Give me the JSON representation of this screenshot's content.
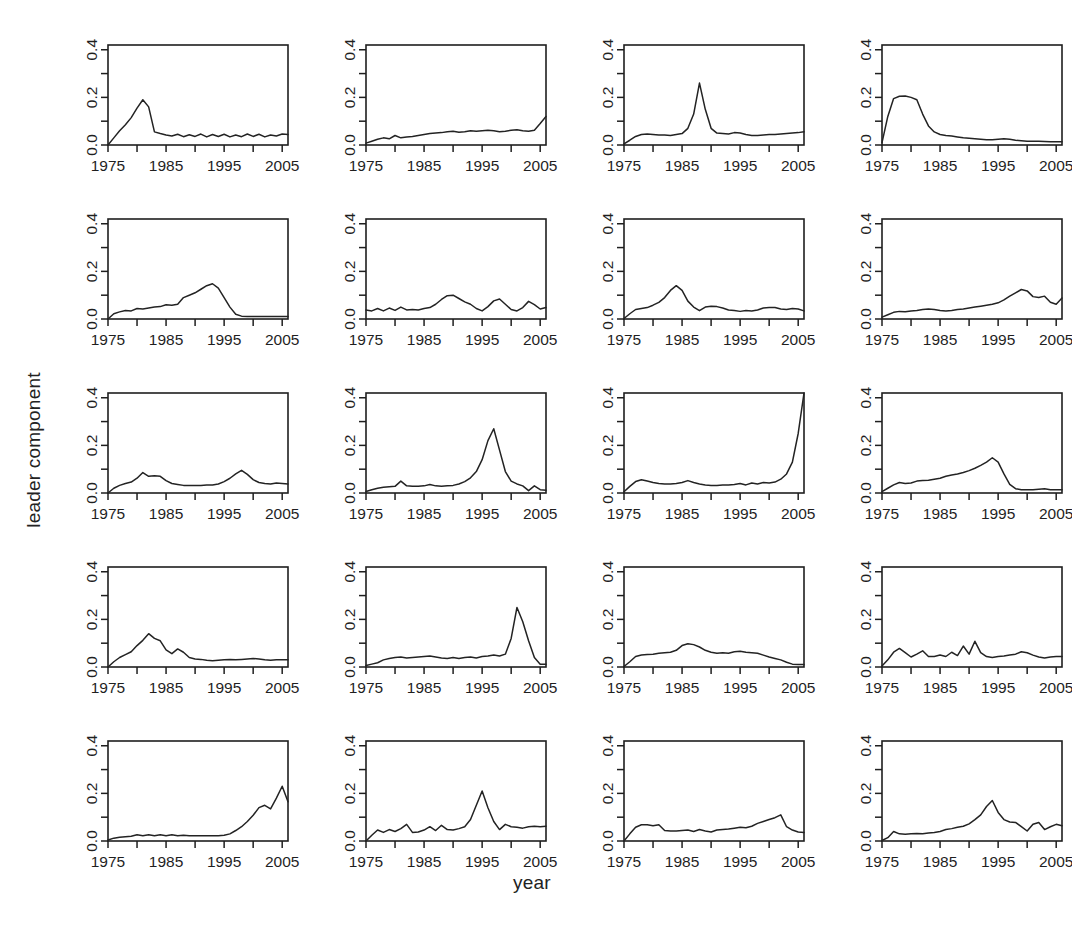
{
  "figure": {
    "xlabel": "year",
    "ylabel": "leader component",
    "rows": 5,
    "cols": 4,
    "line_color": "#232323",
    "axis_color": "#1f1f1f",
    "background": "#ffffff"
  },
  "chart_data": {
    "type": "line",
    "title": "",
    "subtitle": "",
    "xlabel": "year",
    "ylabel": "leader component",
    "layout": {
      "rows": 5,
      "cols": 4,
      "n_panels": 20,
      "shared_axes": true,
      "grid": false,
      "legend": "none"
    },
    "xlim": [
      1975,
      2006
    ],
    "ylim": [
      0.0,
      0.42
    ],
    "xticks": [
      1975,
      1980,
      1985,
      1990,
      1995,
      2000,
      2005
    ],
    "xticklabels": [
      "1975",
      "",
      "1985",
      "",
      "1995",
      "",
      "2005"
    ],
    "yticks": [
      0.0,
      0.1,
      0.2,
      0.3,
      0.4
    ],
    "yticklabels": [
      "0.0",
      "",
      "0.2",
      "",
      "0.4"
    ],
    "x": [
      1975,
      1976,
      1977,
      1978,
      1979,
      1980,
      1981,
      1982,
      1983,
      1984,
      1985,
      1986,
      1987,
      1988,
      1989,
      1990,
      1991,
      1992,
      1993,
      1994,
      1995,
      1996,
      1997,
      1998,
      1999,
      2000,
      2001,
      2002,
      2003,
      2004,
      2005,
      2006
    ],
    "panels": [
      {
        "index": 1,
        "row": 1,
        "col": 1,
        "values": [
          0.0,
          0.03,
          0.06,
          0.085,
          0.115,
          0.155,
          0.19,
          0.16,
          0.055,
          0.048,
          0.042,
          0.038,
          0.045,
          0.035,
          0.043,
          0.036,
          0.046,
          0.034,
          0.044,
          0.036,
          0.045,
          0.034,
          0.042,
          0.035,
          0.046,
          0.036,
          0.045,
          0.034,
          0.042,
          0.038,
          0.046,
          0.044
        ],
        "peak": {
          "year": 1981,
          "value": 0.19
        }
      },
      {
        "index": 2,
        "row": 1,
        "col": 2,
        "values": [
          0.008,
          0.016,
          0.024,
          0.03,
          0.026,
          0.04,
          0.03,
          0.034,
          0.036,
          0.04,
          0.044,
          0.048,
          0.05,
          0.052,
          0.056,
          0.058,
          0.054,
          0.056,
          0.06,
          0.058,
          0.06,
          0.062,
          0.06,
          0.056,
          0.058,
          0.062,
          0.064,
          0.06,
          0.058,
          0.062,
          0.09,
          0.12
        ],
        "peak": {
          "year": 2006,
          "value": 0.12
        }
      },
      {
        "index": 3,
        "row": 1,
        "col": 3,
        "values": [
          0.005,
          0.02,
          0.036,
          0.044,
          0.046,
          0.044,
          0.042,
          0.042,
          0.04,
          0.044,
          0.048,
          0.07,
          0.13,
          0.26,
          0.15,
          0.07,
          0.05,
          0.048,
          0.046,
          0.052,
          0.05,
          0.044,
          0.04,
          0.04,
          0.042,
          0.044,
          0.044,
          0.046,
          0.048,
          0.05,
          0.052,
          0.056
        ],
        "peak": {
          "year": 1988,
          "value": 0.26
        }
      },
      {
        "index": 4,
        "row": 1,
        "col": 4,
        "values": [
          0.01,
          0.12,
          0.195,
          0.205,
          0.206,
          0.2,
          0.19,
          0.13,
          0.08,
          0.055,
          0.044,
          0.04,
          0.038,
          0.034,
          0.03,
          0.028,
          0.026,
          0.024,
          0.022,
          0.022,
          0.024,
          0.026,
          0.024,
          0.02,
          0.018,
          0.016,
          0.016,
          0.016,
          0.015,
          0.014,
          0.014,
          0.014
        ],
        "peak": {
          "year": 1979,
          "value": 0.206
        }
      },
      {
        "index": 5,
        "row": 2,
        "col": 1,
        "values": [
          0.0,
          0.022,
          0.03,
          0.036,
          0.034,
          0.044,
          0.042,
          0.046,
          0.05,
          0.052,
          0.06,
          0.058,
          0.062,
          0.09,
          0.1,
          0.11,
          0.125,
          0.14,
          0.148,
          0.13,
          0.09,
          0.05,
          0.02,
          0.012,
          0.01,
          0.01,
          0.01,
          0.01,
          0.01,
          0.01,
          0.01,
          0.01
        ],
        "peak": {
          "year": 1993,
          "value": 0.148
        }
      },
      {
        "index": 6,
        "row": 2,
        "col": 2,
        "values": [
          0.038,
          0.034,
          0.044,
          0.034,
          0.046,
          0.036,
          0.05,
          0.038,
          0.04,
          0.038,
          0.044,
          0.048,
          0.062,
          0.082,
          0.098,
          0.1,
          0.086,
          0.072,
          0.062,
          0.044,
          0.034,
          0.052,
          0.076,
          0.084,
          0.062,
          0.04,
          0.034,
          0.048,
          0.074,
          0.06,
          0.042,
          0.048
        ],
        "peak": {
          "year": 1990,
          "value": 0.1
        }
      },
      {
        "index": 7,
        "row": 2,
        "col": 3,
        "values": [
          0.002,
          0.022,
          0.04,
          0.044,
          0.048,
          0.058,
          0.07,
          0.09,
          0.12,
          0.14,
          0.12,
          0.075,
          0.05,
          0.035,
          0.05,
          0.054,
          0.052,
          0.046,
          0.038,
          0.036,
          0.032,
          0.036,
          0.034,
          0.038,
          0.046,
          0.048,
          0.048,
          0.042,
          0.04,
          0.044,
          0.042,
          0.034
        ],
        "peak": {
          "year": 1984,
          "value": 0.14
        }
      },
      {
        "index": 8,
        "row": 2,
        "col": 4,
        "values": [
          0.008,
          0.018,
          0.028,
          0.032,
          0.03,
          0.034,
          0.036,
          0.04,
          0.042,
          0.04,
          0.036,
          0.034,
          0.036,
          0.04,
          0.042,
          0.046,
          0.05,
          0.054,
          0.058,
          0.062,
          0.068,
          0.08,
          0.096,
          0.11,
          0.124,
          0.118,
          0.094,
          0.09,
          0.096,
          0.07,
          0.062,
          0.088
        ],
        "peak": {
          "year": 1999,
          "value": 0.124
        }
      },
      {
        "index": 9,
        "row": 3,
        "col": 1,
        "values": [
          0.0,
          0.02,
          0.032,
          0.04,
          0.046,
          0.062,
          0.086,
          0.07,
          0.072,
          0.07,
          0.052,
          0.04,
          0.036,
          0.032,
          0.032,
          0.032,
          0.032,
          0.034,
          0.034,
          0.038,
          0.048,
          0.062,
          0.08,
          0.095,
          0.078,
          0.056,
          0.044,
          0.04,
          0.038,
          0.042,
          0.04,
          0.038
        ],
        "peak": {
          "year": 1998,
          "value": 0.095
        }
      },
      {
        "index": 10,
        "row": 3,
        "col": 2,
        "values": [
          0.006,
          0.014,
          0.02,
          0.024,
          0.026,
          0.028,
          0.05,
          0.03,
          0.028,
          0.028,
          0.03,
          0.036,
          0.03,
          0.028,
          0.03,
          0.032,
          0.038,
          0.048,
          0.064,
          0.09,
          0.14,
          0.22,
          0.27,
          0.18,
          0.09,
          0.05,
          0.038,
          0.03,
          0.01,
          0.03,
          0.014,
          0.012
        ],
        "peak": {
          "year": 1997,
          "value": 0.27
        }
      },
      {
        "index": 11,
        "row": 3,
        "col": 3,
        "values": [
          0.005,
          0.028,
          0.048,
          0.056,
          0.05,
          0.044,
          0.04,
          0.038,
          0.038,
          0.04,
          0.044,
          0.052,
          0.044,
          0.038,
          0.034,
          0.032,
          0.032,
          0.034,
          0.034,
          0.036,
          0.04,
          0.034,
          0.042,
          0.038,
          0.044,
          0.042,
          0.046,
          0.058,
          0.08,
          0.13,
          0.25,
          0.42
        ],
        "peak": {
          "year": 2006,
          "value": 0.42
        }
      },
      {
        "index": 12,
        "row": 3,
        "col": 4,
        "values": [
          0.006,
          0.02,
          0.034,
          0.044,
          0.04,
          0.042,
          0.05,
          0.052,
          0.054,
          0.058,
          0.062,
          0.07,
          0.076,
          0.08,
          0.086,
          0.094,
          0.104,
          0.116,
          0.13,
          0.148,
          0.13,
          0.08,
          0.036,
          0.018,
          0.014,
          0.014,
          0.014,
          0.016,
          0.018,
          0.014,
          0.014,
          0.014
        ],
        "peak": {
          "year": 1994,
          "value": 0.148
        }
      },
      {
        "index": 13,
        "row": 4,
        "col": 1,
        "values": [
          0.0,
          0.022,
          0.04,
          0.052,
          0.064,
          0.09,
          0.112,
          0.14,
          0.12,
          0.11,
          0.072,
          0.056,
          0.076,
          0.062,
          0.04,
          0.034,
          0.032,
          0.028,
          0.026,
          0.028,
          0.03,
          0.032,
          0.03,
          0.032,
          0.034,
          0.036,
          0.034,
          0.03,
          0.028,
          0.03,
          0.03,
          0.03
        ],
        "peak": {
          "year": 1982,
          "value": 0.14
        }
      },
      {
        "index": 14,
        "row": 4,
        "col": 2,
        "values": [
          0.006,
          0.012,
          0.018,
          0.03,
          0.036,
          0.04,
          0.042,
          0.038,
          0.04,
          0.042,
          0.044,
          0.046,
          0.042,
          0.038,
          0.036,
          0.04,
          0.036,
          0.04,
          0.042,
          0.038,
          0.044,
          0.046,
          0.05,
          0.046,
          0.054,
          0.12,
          0.25,
          0.19,
          0.11,
          0.04,
          0.012,
          0.012
        ],
        "peak": {
          "year": 2001,
          "value": 0.25
        }
      },
      {
        "index": 15,
        "row": 4,
        "col": 3,
        "values": [
          0.002,
          0.022,
          0.044,
          0.05,
          0.052,
          0.054,
          0.058,
          0.06,
          0.062,
          0.07,
          0.09,
          0.098,
          0.094,
          0.084,
          0.07,
          0.062,
          0.058,
          0.06,
          0.058,
          0.064,
          0.066,
          0.062,
          0.06,
          0.058,
          0.05,
          0.042,
          0.036,
          0.03,
          0.02,
          0.012,
          0.01,
          0.01
        ],
        "peak": {
          "year": 1986,
          "value": 0.098
        }
      },
      {
        "index": 16,
        "row": 4,
        "col": 4,
        "values": [
          0.004,
          0.03,
          0.062,
          0.078,
          0.06,
          0.042,
          0.054,
          0.068,
          0.044,
          0.044,
          0.05,
          0.044,
          0.062,
          0.048,
          0.088,
          0.054,
          0.108,
          0.06,
          0.044,
          0.04,
          0.044,
          0.046,
          0.05,
          0.054,
          0.064,
          0.06,
          0.05,
          0.042,
          0.038,
          0.042,
          0.044,
          0.044
        ],
        "peak": {
          "year": 1991,
          "value": 0.108
        }
      },
      {
        "index": 17,
        "row": 5,
        "col": 1,
        "values": [
          0.004,
          0.012,
          0.016,
          0.018,
          0.02,
          0.026,
          0.022,
          0.026,
          0.022,
          0.026,
          0.022,
          0.026,
          0.022,
          0.024,
          0.022,
          0.022,
          0.022,
          0.022,
          0.022,
          0.022,
          0.024,
          0.03,
          0.044,
          0.06,
          0.082,
          0.108,
          0.14,
          0.15,
          0.135,
          0.18,
          0.23,
          0.165
        ],
        "peak": {
          "year": 2005,
          "value": 0.23
        }
      },
      {
        "index": 18,
        "row": 5,
        "col": 2,
        "values": [
          0.0,
          0.024,
          0.046,
          0.036,
          0.048,
          0.04,
          0.052,
          0.07,
          0.036,
          0.038,
          0.046,
          0.06,
          0.044,
          0.066,
          0.048,
          0.046,
          0.052,
          0.06,
          0.09,
          0.15,
          0.21,
          0.14,
          0.082,
          0.048,
          0.07,
          0.06,
          0.058,
          0.054,
          0.06,
          0.062,
          0.06,
          0.062
        ],
        "peak": {
          "year": 1995,
          "value": 0.21
        }
      },
      {
        "index": 19,
        "row": 5,
        "col": 3,
        "values": [
          0.0,
          0.03,
          0.058,
          0.068,
          0.068,
          0.064,
          0.068,
          0.044,
          0.042,
          0.042,
          0.044,
          0.046,
          0.04,
          0.048,
          0.042,
          0.038,
          0.046,
          0.048,
          0.05,
          0.054,
          0.058,
          0.056,
          0.062,
          0.074,
          0.082,
          0.09,
          0.098,
          0.11,
          0.06,
          0.046,
          0.038,
          0.036
        ],
        "peak": {
          "year": 2002,
          "value": 0.11
        }
      },
      {
        "index": 20,
        "row": 5,
        "col": 4,
        "values": [
          0.002,
          0.014,
          0.04,
          0.03,
          0.028,
          0.03,
          0.032,
          0.03,
          0.034,
          0.036,
          0.04,
          0.048,
          0.052,
          0.058,
          0.062,
          0.072,
          0.09,
          0.11,
          0.145,
          0.17,
          0.12,
          0.09,
          0.08,
          0.078,
          0.06,
          0.042,
          0.07,
          0.078,
          0.048,
          0.06,
          0.07,
          0.064
        ],
        "peak": {
          "year": 1994,
          "value": 0.17
        }
      }
    ]
  }
}
